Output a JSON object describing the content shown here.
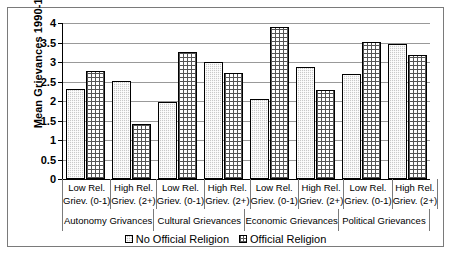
{
  "chart_data": {
    "type": "bar",
    "title": "",
    "xlabel": "",
    "ylabel": "Mean Grievances 1990-1995",
    "ylim": [
      0,
      4
    ],
    "ytick_labels": [
      "4",
      "3.5",
      "3",
      "2.5",
      "2",
      "1.5",
      "1",
      "0.5",
      "0"
    ],
    "ytick_values": [
      4,
      3.5,
      3,
      2.5,
      2,
      1.5,
      1,
      0.5,
      0
    ],
    "grid": true,
    "legend_position": "bottom",
    "categories": [
      "Low Rel. Griev. (0-1)",
      "High Rel. Griev. (2+)",
      "Low Rel. Griev. (0-1)",
      "High Rel. Griev. (2+)",
      "Low Rel. Griev. (0-1)",
      "High Rel. Griev. (2+)",
      "Low Rel. Griev. (0-1)",
      "High Rel. Griev. (2+)"
    ],
    "category_lines": [
      [
        "Low Rel.",
        "Griev. (0-1)"
      ],
      [
        "High Rel.",
        "Griev. (2+)"
      ],
      [
        "Low Rel.",
        "Griev. (0-1)"
      ],
      [
        "High Rel.",
        "Griev. (2+)"
      ],
      [
        "Low Rel.",
        "Griev. (0-1)"
      ],
      [
        "High Rel.",
        "Griev. (2+)"
      ],
      [
        "Low Rel.",
        "Griev. (0-1)"
      ],
      [
        "High Rel.",
        "Griev. (2+)"
      ]
    ],
    "groups": [
      "Autonomy Grivances",
      "Cultural Grievances",
      "Economic Grievances",
      "Political Grievances"
    ],
    "series": [
      {
        "name": "No Official Religion",
        "values": [
          2.3,
          2.52,
          1.97,
          2.99,
          2.04,
          2.87,
          2.68,
          3.45
        ]
      },
      {
        "name": "Official Religion",
        "values": [
          2.77,
          1.4,
          3.26,
          2.73,
          3.89,
          2.29,
          3.52,
          3.19
        ]
      }
    ]
  },
  "legend": {
    "items": [
      {
        "label": "No Official Religion",
        "swatch": "dotted-fill-swatch"
      },
      {
        "label": "Official Religion",
        "swatch": "grid-fill-swatch"
      }
    ]
  }
}
